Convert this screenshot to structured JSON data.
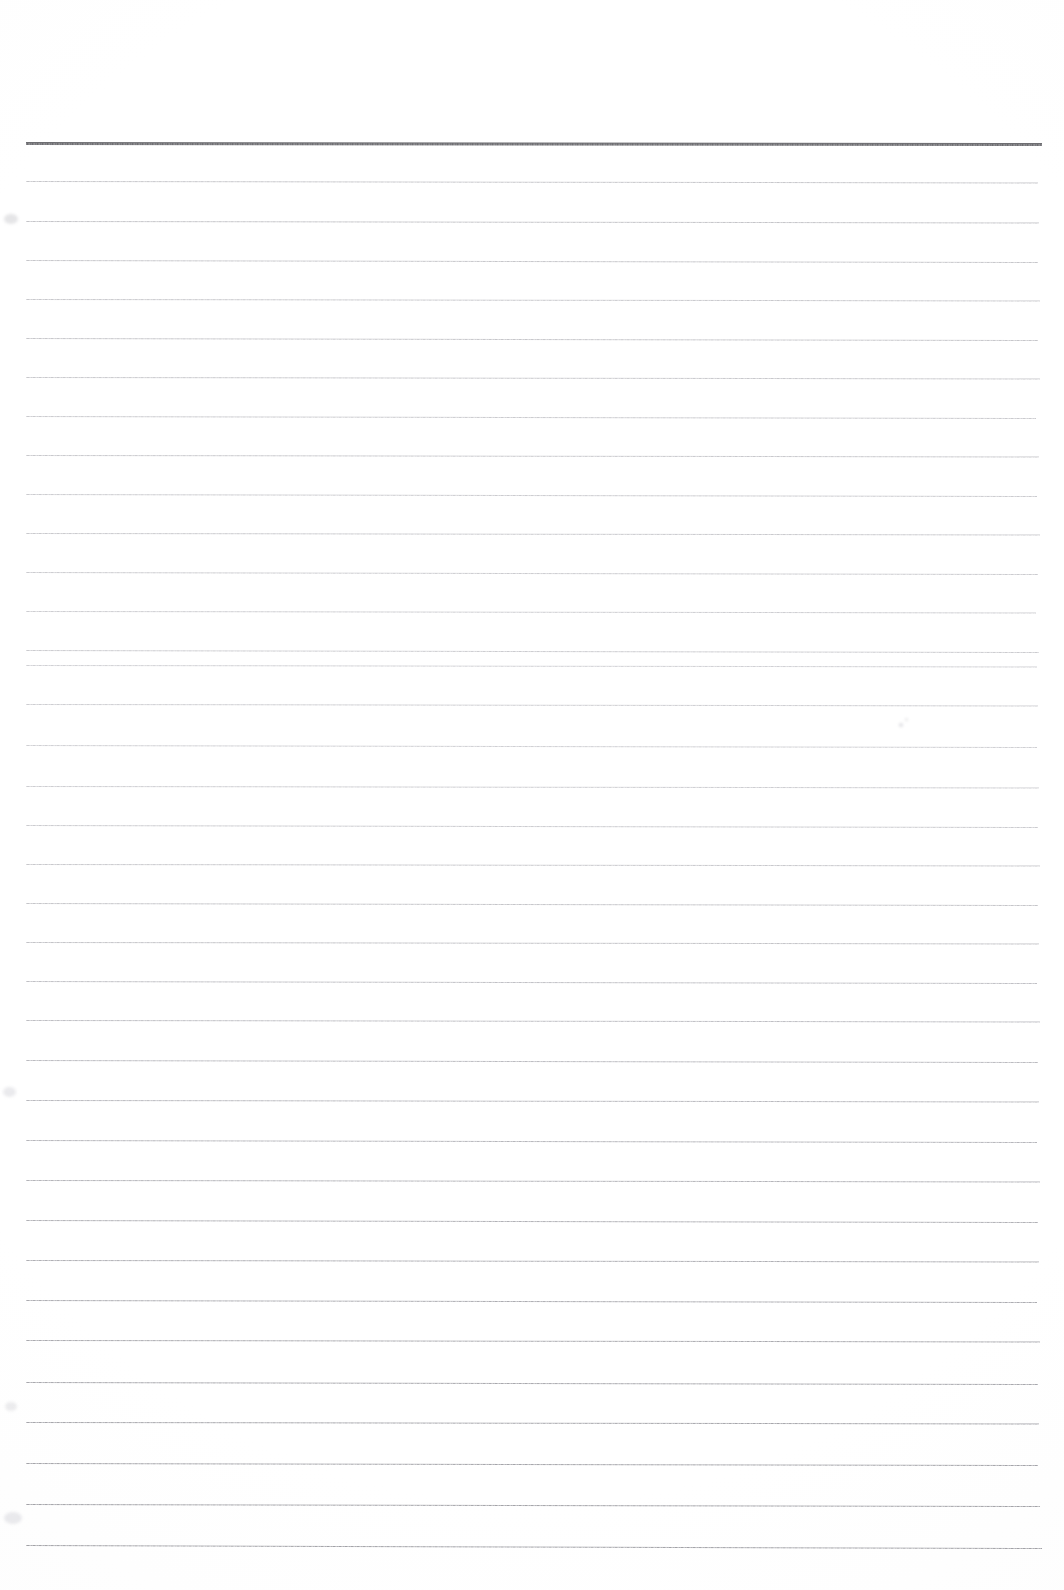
{
  "document": {
    "kind": "scanned-ruled-notepaper",
    "title": "Blank Ruled Notepaper",
    "page_width": 1064,
    "page_height": 1590,
    "background_color": "#ffffff",
    "body_text": "",
    "has_text_content": false,
    "orientation": "portrait"
  },
  "ruling": {
    "left_margin_x": 26,
    "right_edge_x": 1040,
    "first_line_y": 142,
    "last_line_y": 1545,
    "line_count": 36,
    "average_spacing_px": 40,
    "skew_note": "lines drift ~3px lower toward the right edge",
    "header_rule": {
      "label": "header-rule",
      "y": 142,
      "thickness_px": 3,
      "color": "#6e6e72",
      "left_x": 26,
      "right_x": 1042
    },
    "body_rule_color_top": "#c9c9cd",
    "body_rule_color_middle": "#d2d2d6",
    "body_rule_color_bottom": "#a8a8ad",
    "body_rule_thickness_px": 1
  },
  "lines": [
    {
      "index": 0,
      "y": 142,
      "color": "#6e6e72",
      "thickness": 3,
      "left": 26,
      "right": 1042,
      "skew": 1.0,
      "role": "header"
    },
    {
      "index": 1,
      "y": 181,
      "color": "#c6c6ca",
      "thickness": 1,
      "left": 26,
      "right": 1038,
      "skew": 1.5,
      "role": "body"
    },
    {
      "index": 2,
      "y": 221,
      "color": "#c4c4c8",
      "thickness": 1,
      "left": 26,
      "right": 1039,
      "skew": 1.5,
      "role": "body"
    },
    {
      "index": 3,
      "y": 260,
      "color": "#c6c6ca",
      "thickness": 1,
      "left": 26,
      "right": 1038,
      "skew": 2.0,
      "role": "body"
    },
    {
      "index": 4,
      "y": 299,
      "color": "#c8c8cc",
      "thickness": 1,
      "left": 26,
      "right": 1040,
      "skew": 1.5,
      "role": "body"
    },
    {
      "index": 5,
      "y": 338,
      "color": "#c6c6ca",
      "thickness": 1,
      "left": 26,
      "right": 1038,
      "skew": 2.0,
      "role": "body"
    },
    {
      "index": 6,
      "y": 377,
      "color": "#c8c8cc",
      "thickness": 1,
      "left": 26,
      "right": 1040,
      "skew": 1.5,
      "role": "body"
    },
    {
      "index": 7,
      "y": 416,
      "color": "#cacace",
      "thickness": 1,
      "left": 26,
      "right": 1036,
      "skew": 2.0,
      "role": "body"
    },
    {
      "index": 8,
      "y": 455,
      "color": "#c8c8cc",
      "thickness": 1,
      "left": 26,
      "right": 1039,
      "skew": 1.5,
      "role": "body"
    },
    {
      "index": 9,
      "y": 494,
      "color": "#cbcbcf",
      "thickness": 1,
      "left": 26,
      "right": 1037,
      "skew": 2.0,
      "role": "body"
    },
    {
      "index": 10,
      "y": 533,
      "color": "#c9c9cd",
      "thickness": 1,
      "left": 26,
      "right": 1040,
      "skew": 1.5,
      "role": "body"
    },
    {
      "index": 11,
      "y": 572,
      "color": "#cbcbcf",
      "thickness": 1,
      "left": 26,
      "right": 1038,
      "skew": 2.0,
      "role": "body"
    },
    {
      "index": 12,
      "y": 611,
      "color": "#cdcdd1",
      "thickness": 1,
      "left": 26,
      "right": 1036,
      "skew": 1.5,
      "role": "body"
    },
    {
      "index": 13,
      "y": 650,
      "color": "#cbcbcf",
      "thickness": 1,
      "left": 26,
      "right": 1039,
      "skew": 2.0,
      "role": "body"
    },
    {
      "index": 14,
      "y": 665,
      "color": "#d0d0d4",
      "thickness": 1,
      "left": 26,
      "right": 1037,
      "skew": 1.5,
      "role": "body"
    },
    {
      "index": 15,
      "y": 704,
      "color": "#cdcdd1",
      "thickness": 1,
      "left": 26,
      "right": 1038,
      "skew": 1.5,
      "role": "body"
    },
    {
      "index": 16,
      "y": 745,
      "color": "#cfcfd3",
      "thickness": 1,
      "left": 26,
      "right": 1037,
      "skew": 2.0,
      "role": "body"
    },
    {
      "index": 17,
      "y": 786,
      "color": "#cdcdd1",
      "thickness": 1,
      "left": 26,
      "right": 1039,
      "skew": 1.5,
      "role": "body"
    },
    {
      "index": 18,
      "y": 825,
      "color": "#cbcbcf",
      "thickness": 1,
      "left": 26,
      "right": 1038,
      "skew": 2.0,
      "role": "body"
    },
    {
      "index": 19,
      "y": 864,
      "color": "#c8c8cc",
      "thickness": 1,
      "left": 26,
      "right": 1040,
      "skew": 1.5,
      "role": "body"
    },
    {
      "index": 20,
      "y": 903,
      "color": "#c5c5c9",
      "thickness": 1,
      "left": 26,
      "right": 1038,
      "skew": 2.0,
      "role": "body"
    },
    {
      "index": 21,
      "y": 942,
      "color": "#c3c3c7",
      "thickness": 1,
      "left": 26,
      "right": 1039,
      "skew": 1.5,
      "role": "body"
    },
    {
      "index": 22,
      "y": 981,
      "color": "#c0c0c5",
      "thickness": 1,
      "left": 26,
      "right": 1037,
      "skew": 2.0,
      "role": "body"
    },
    {
      "index": 23,
      "y": 1020,
      "color": "#bebec3",
      "thickness": 1,
      "left": 26,
      "right": 1040,
      "skew": 1.5,
      "role": "body"
    },
    {
      "index": 24,
      "y": 1060,
      "color": "#bbbbc0",
      "thickness": 1,
      "left": 26,
      "right": 1038,
      "skew": 2.0,
      "role": "body"
    },
    {
      "index": 25,
      "y": 1100,
      "color": "#b9b9be",
      "thickness": 1,
      "left": 26,
      "right": 1039,
      "skew": 1.5,
      "role": "body"
    },
    {
      "index": 26,
      "y": 1140,
      "color": "#b6b6bb",
      "thickness": 1,
      "left": 26,
      "right": 1037,
      "skew": 2.0,
      "role": "body"
    },
    {
      "index": 27,
      "y": 1180,
      "color": "#b4b4b9",
      "thickness": 1,
      "left": 26,
      "right": 1040,
      "skew": 1.5,
      "role": "body"
    },
    {
      "index": 28,
      "y": 1220,
      "color": "#b1b1b6",
      "thickness": 1,
      "left": 26,
      "right": 1038,
      "skew": 2.0,
      "role": "body"
    },
    {
      "index": 29,
      "y": 1260,
      "color": "#afafb4",
      "thickness": 1,
      "left": 26,
      "right": 1039,
      "skew": 1.5,
      "role": "body"
    },
    {
      "index": 30,
      "y": 1300,
      "color": "#acacb1",
      "thickness": 1,
      "left": 26,
      "right": 1037,
      "skew": 2.0,
      "role": "body"
    },
    {
      "index": 31,
      "y": 1340,
      "color": "#aaaaaf",
      "thickness": 1,
      "left": 26,
      "right": 1040,
      "skew": 1.5,
      "role": "body"
    },
    {
      "index": 32,
      "y": 1382,
      "color": "#a8a8ad",
      "thickness": 1,
      "left": 26,
      "right": 1038,
      "skew": 2.0,
      "role": "body"
    },
    {
      "index": 33,
      "y": 1422,
      "color": "#a6a6ab",
      "thickness": 1,
      "left": 26,
      "right": 1039,
      "skew": 1.5,
      "role": "body"
    },
    {
      "index": 34,
      "y": 1463,
      "color": "#a4a4a9",
      "thickness": 1,
      "left": 26,
      "right": 1038,
      "skew": 2.0,
      "role": "body"
    },
    {
      "index": 35,
      "y": 1504,
      "color": "#a3a3a8",
      "thickness": 1,
      "left": 26,
      "right": 1040,
      "skew": 2.0,
      "role": "body"
    },
    {
      "index": 36,
      "y": 1545,
      "color": "#a1a1a6",
      "thickness": 1,
      "left": 26,
      "right": 1042,
      "skew": 3.0,
      "role": "body"
    }
  ],
  "artifacts": [
    {
      "name": "scan-smudge-left-upper",
      "x": 4,
      "y": 214,
      "w": 14,
      "h": 10,
      "color": "rgba(190,190,196,0.40)"
    },
    {
      "name": "scan-smudge-left-mid",
      "x": 3,
      "y": 1087,
      "w": 13,
      "h": 10,
      "color": "rgba(196,196,202,0.35)"
    },
    {
      "name": "scan-smudge-left-lower",
      "x": 5,
      "y": 1402,
      "w": 12,
      "h": 9,
      "color": "rgba(198,198,204,0.33)"
    },
    {
      "name": "scan-smudge-bottom-left",
      "x": 4,
      "y": 1512,
      "w": 18,
      "h": 12,
      "color": "rgba(196,196,202,0.35)"
    },
    {
      "name": "scan-speck-center",
      "x": 899,
      "y": 723,
      "w": 4,
      "h": 4,
      "color": "rgba(180,180,188,0.45)"
    },
    {
      "name": "scan-speck-upper",
      "x": 905,
      "y": 718,
      "w": 3,
      "h": 3,
      "color": "rgba(188,188,195,0.40)"
    }
  ]
}
